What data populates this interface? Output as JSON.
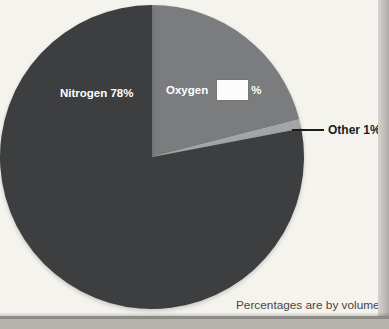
{
  "chart_data": {
    "type": "pie",
    "note": "Percentages are by volume.",
    "start_angle_deg": 0,
    "direction": "clockwise-from-top",
    "slices": [
      {
        "name": "Oxygen",
        "value": 21,
        "label": "Oxygen",
        "value_display": "",
        "suffix": "%",
        "answer_blank": true,
        "color": "#7a7c7e",
        "label_color": "#ffffff"
      },
      {
        "name": "Other",
        "value": 1,
        "label": "Other 1%",
        "color": "#a3a5a7",
        "label_color": "#1c1c1c",
        "label_outside": true
      },
      {
        "name": "Nitrogen",
        "value": 78,
        "label": "Nitrogen 78%",
        "color": "#3d3e40",
        "label_color": "#ffffff"
      }
    ]
  }
}
